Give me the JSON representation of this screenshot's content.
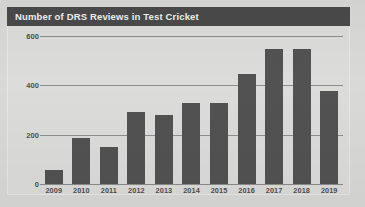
{
  "figure": {
    "title": "Number of DRS Reviews in Test Cricket",
    "header_color": "#4a4a4a",
    "background_color": "#dcdcda",
    "page_background_color": "#d9d9d7",
    "bar_color": "#525252",
    "gridline_color": "#8e8e8e"
  },
  "chart_data": {
    "type": "bar",
    "title": "Number of DRS Reviews in Test Cricket",
    "xlabel": "",
    "ylabel": "",
    "categories": [
      "2009",
      "2010",
      "2011",
      "2012",
      "2013",
      "2014",
      "2015",
      "2016",
      "2017",
      "2018",
      "2019"
    ],
    "values": [
      55,
      185,
      150,
      290,
      280,
      330,
      330,
      445,
      545,
      545,
      377
    ],
    "series": [
      {
        "name": "DRS Reviews",
        "values": [
          55,
          185,
          150,
          290,
          280,
          330,
          330,
          445,
          545,
          545,
          377
        ]
      }
    ],
    "ylim": [
      0,
      640
    ],
    "yticks": [
      0,
      200,
      400,
      600
    ],
    "ytick_labels": [
      "0",
      "200",
      "400",
      "600"
    ],
    "grid": true,
    "grid_axis": "y",
    "legend": false,
    "legend_position": "none"
  }
}
